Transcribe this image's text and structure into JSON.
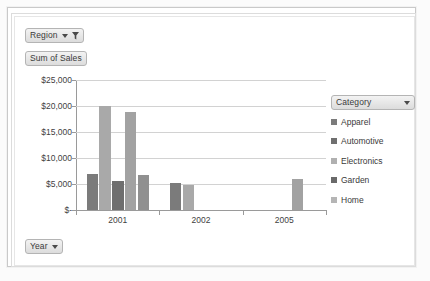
{
  "pivot": {
    "region_button": {
      "label": "Region",
      "icon": "filter-funnel-icon",
      "has_caret": true,
      "has_filter": true
    },
    "value_button": {
      "label": "Sum of Sales"
    },
    "year_button": {
      "label": "Year",
      "has_caret": true
    },
    "category_button": {
      "label": "Category",
      "has_caret": true
    }
  },
  "chart_data": {
    "type": "bar",
    "title": "Sum of Sales",
    "xlabel": "Year",
    "ylabel": "Sum of Sales",
    "categories": [
      "2001",
      "2002",
      "2005"
    ],
    "ytick_labels": [
      "$25,000",
      "$20,000",
      "$15,000",
      "$10,000",
      "$5,000",
      "$-"
    ],
    "ytick_values": [
      25000,
      20000,
      15000,
      10000,
      5000,
      0
    ],
    "ylim": [
      0,
      25000
    ],
    "grid": true,
    "legend_position": "right",
    "legend_title": "Category",
    "series": [
      {
        "name": "Apparel",
        "color": "#7b7b7b",
        "values": [
          7000,
          5200,
          0
        ]
      },
      {
        "name": "Automotive",
        "color": "#a9a9a9",
        "values": [
          20000,
          4900,
          0
        ]
      },
      {
        "name": "Electronics",
        "color": "#6f6f6f",
        "values": [
          5600,
          0,
          0
        ]
      },
      {
        "name": "Garden",
        "color": "#a2a2a2",
        "values": [
          18800,
          0,
          6000
        ]
      },
      {
        "name": "Home",
        "color": "#909090",
        "values": [
          6800,
          0,
          0
        ]
      }
    ]
  },
  "legend": {
    "items": [
      {
        "label": "Apparel",
        "color": "#7b7b7b"
      },
      {
        "label": "Automotive",
        "color": "#6f6f6f"
      },
      {
        "label": "Electronics",
        "color": "#b0b0b0"
      },
      {
        "label": "Garden",
        "color": "#6a6a6a"
      },
      {
        "label": "Home",
        "color": "#b5b5b5"
      }
    ]
  },
  "colors": {
    "plot_bg": "#ffffff",
    "gridline": "#d2d2d2",
    "axis": "#9a9a9a",
    "text": "#3f3f3f",
    "button_border": "#b4b4b4"
  }
}
